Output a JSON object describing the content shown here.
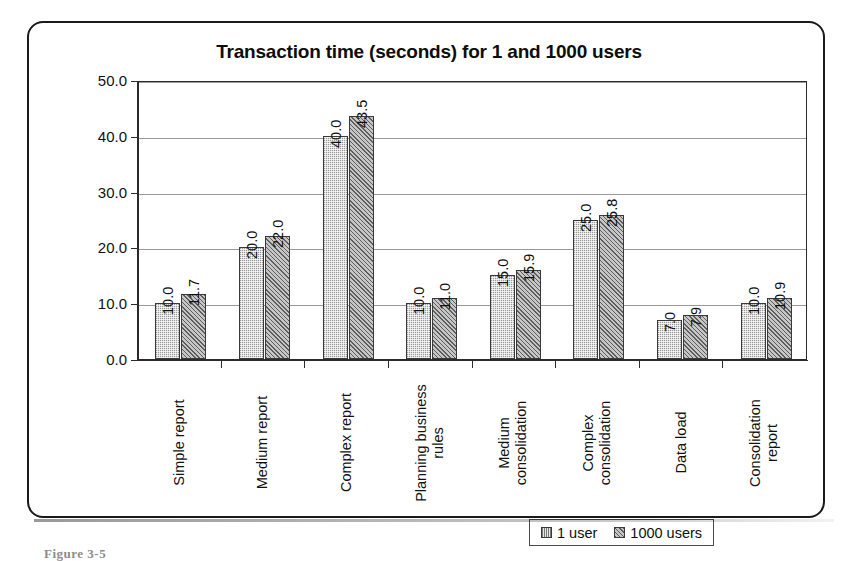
{
  "figure": {
    "clipped_caption": "Figure 3-5"
  },
  "legend": {
    "position": "bottom-right",
    "entries": [
      {
        "label": "1 user",
        "swatch": "light-stipple-swatch"
      },
      {
        "label": "1000 users",
        "swatch": "dark-hatch-swatch"
      }
    ]
  },
  "chart_data": {
    "type": "bar",
    "title": "Transaction time (seconds) for 1 and 1000 users",
    "xlabel": "",
    "ylabel": "",
    "ylim": [
      0,
      50
    ],
    "yticks": [
      "0.0",
      "10.0",
      "20.0",
      "30.0",
      "40.0",
      "50.0"
    ],
    "ytick_values": [
      0,
      10,
      20,
      30,
      40,
      50
    ],
    "grid": true,
    "legend_position": "bottom-right",
    "categories": [
      "Simple report",
      "Medium report",
      "Complex report",
      "Planning business\nrules",
      "Medium\nconsolidation",
      "Complex\nconsolidation",
      "Data load",
      "Consolidation\nreport"
    ],
    "series": [
      {
        "name": "1 user",
        "color": "#c2c2c2",
        "values": [
          10.0,
          20.0,
          40.0,
          10.0,
          15.0,
          25.0,
          7.0,
          10.0
        ],
        "labels": [
          "10.0",
          "20.0",
          "40.0",
          "10.0",
          "15.0",
          "25.0",
          "7.0",
          "10.0"
        ]
      },
      {
        "name": "1000 users",
        "color": "#8f8f8f",
        "values": [
          11.7,
          22.0,
          43.5,
          11.0,
          15.9,
          25.8,
          7.9,
          10.9
        ],
        "labels": [
          "11.7",
          "22.0",
          "43.5",
          "11.0",
          "15.9",
          "25.8",
          "7.9",
          "10.9"
        ]
      }
    ]
  }
}
